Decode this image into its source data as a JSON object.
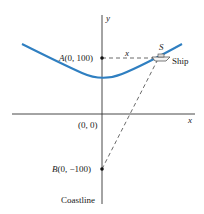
{
  "diagram": {
    "axes": {
      "x_label": "x",
      "y_label": "y",
      "origin_label": "(0, 0)"
    },
    "points": {
      "A": {
        "name": "A",
        "coords": "(0, 100)"
      },
      "B": {
        "name": "B",
        "coords": "(0, −100)"
      },
      "S": {
        "name": "S"
      }
    },
    "labels": {
      "distance": "x",
      "ship": "Ship",
      "coastline": "Coastline"
    },
    "colors": {
      "curve": "#2f7fc1",
      "axes": "#333333",
      "dashed": "#444444"
    }
  }
}
